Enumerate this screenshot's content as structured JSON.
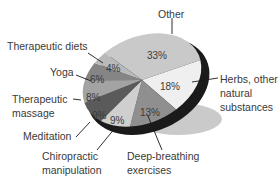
{
  "chart_data": {
    "type": "pie",
    "title": "",
    "style": "3d-tilted-pie",
    "slices": [
      {
        "label": "Other",
        "value": 33,
        "pct_label": "33%",
        "color": "#c9c9c9"
      },
      {
        "label": "Herbs, other natural substances",
        "value": 18,
        "pct_label": "18%",
        "color": "#efefef"
      },
      {
        "label": "Deep-breathing exercises",
        "value": 13,
        "pct_label": "13%",
        "color": "#8f8f8f"
      },
      {
        "label": "Chiropractic manipulation",
        "value": 9,
        "pct_label": "9%",
        "color": "#cfcfcf"
      },
      {
        "label": "Meditation",
        "value": 9,
        "pct_label": "9%",
        "color": "#5a5a5a"
      },
      {
        "label": "Therapeutic massage",
        "value": 8,
        "pct_label": "8%",
        "color": "#a3a3a3"
      },
      {
        "label": "Yoga",
        "value": 6,
        "pct_label": "6%",
        "color": "#858585"
      },
      {
        "label": "Therapeutic diets",
        "value": 4,
        "pct_label": "4%",
        "color": "#b9b9b9"
      }
    ],
    "label_lines": {
      "other": [
        "Other"
      ],
      "herbs": [
        "Herbs, other",
        "natural",
        "substances"
      ],
      "deep": [
        "Deep-breathing",
        "exercises"
      ],
      "chiro": [
        "Chiropractic",
        "manipulation"
      ],
      "meditation": [
        "Meditation"
      ],
      "massage": [
        "Therapeutic",
        "massage"
      ],
      "yoga": [
        "Yoga"
      ],
      "diets": [
        "Therapeutic diets"
      ]
    },
    "edge_color": "#1a1a1a",
    "shadow_color": "#c4c4c4",
    "legend_position": "none"
  }
}
